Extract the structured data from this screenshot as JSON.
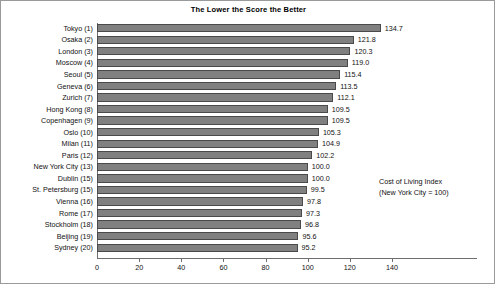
{
  "chart_data": {
    "type": "bar",
    "orientation": "horizontal",
    "title": "The Lower the Score the Better",
    "xlabel": "",
    "ylabel": "",
    "xlim": [
      0,
      140
    ],
    "xticks": [
      0,
      20,
      40,
      60,
      80,
      100,
      120,
      140
    ],
    "grid": false,
    "legend_position": "inside-right",
    "annotations": [
      "Cost of Living Index",
      "(New York City = 100)"
    ],
    "bar_color": "#808080",
    "bar_edge_color": "#4a4a4a",
    "categories": [
      "Tokyo (1)",
      "Osaka (2)",
      "London (3)",
      "Moscow (4)",
      "Seoul (5)",
      "Geneva (6)",
      "Zurich (7)",
      "Hong Kong (8)",
      "Copenhagen (9)",
      "Oslo (10)",
      "Milan (11)",
      "Paris (12)",
      "New York City (13)",
      "Dublin (15)",
      "St. Petersburg (15)",
      "Vienna (16)",
      "Rome (17)",
      "Stockholm (18)",
      "Beijing (19)",
      "Sydney (20)"
    ],
    "values": [
      134.7,
      121.8,
      120.3,
      119.0,
      115.4,
      113.5,
      112.1,
      109.5,
      109.5,
      105.3,
      104.9,
      102.2,
      100.0,
      100.0,
      99.5,
      97.8,
      97.3,
      96.8,
      95.6,
      95.2
    ],
    "value_labels": [
      "134.7",
      "121.8",
      "120.3",
      "119.0",
      "115.4",
      "113.5",
      "112.1",
      "109.5",
      "109.5",
      "105.3",
      "104.9",
      "102.2",
      "100.0",
      "100.0",
      "99.5",
      "97.8",
      "97.3",
      "96.8",
      "95.6",
      "95.2"
    ],
    "xtick_labels": [
      "0",
      "20",
      "40",
      "60",
      "80",
      "100",
      "120",
      "140"
    ]
  }
}
